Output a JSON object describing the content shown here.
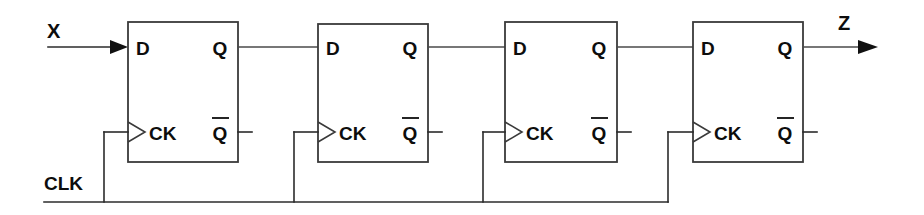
{
  "diagram": {
    "type": "logic-circuit-schematic",
    "background_color": "#ffffff",
    "line_color": "#2b2b2b",
    "text_color": "#0d0d0d"
  },
  "io": {
    "input_label": "X",
    "output_label": "Z",
    "clock_label": "CLK"
  },
  "pins": {
    "d": "D",
    "q": "Q",
    "qbar": "Q",
    "ck": "CK"
  },
  "flipflops": [
    {
      "index": 1,
      "d_label": "D",
      "q_label": "Q",
      "qbar_label": "Q",
      "ck_label": "CK"
    },
    {
      "index": 2,
      "d_label": "D",
      "q_label": "Q",
      "qbar_label": "Q",
      "ck_label": "CK"
    },
    {
      "index": 3,
      "d_label": "D",
      "q_label": "Q",
      "qbar_label": "Q",
      "ck_label": "CK"
    },
    {
      "index": 4,
      "d_label": "D",
      "q_label": "Q",
      "qbar_label": "Q",
      "ck_label": "CK"
    }
  ]
}
